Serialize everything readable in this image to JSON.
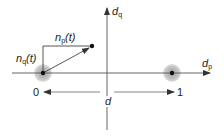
{
  "diagram": {
    "type": "constellation-noise-diagram",
    "axes": {
      "horizontal": {
        "symbol": "d",
        "subscript": "p"
      },
      "vertical": {
        "symbol": "d",
        "subscript": "q"
      }
    },
    "noise_labels": {
      "in_phase": {
        "symbol": "n",
        "subscript": "p",
        "arg": "(t)"
      },
      "quadrature": {
        "symbol": "n",
        "subscript": "q",
        "arg": "(t)"
      }
    },
    "points": [
      {
        "name": "symbol-0",
        "x": 43,
        "y": 73
      },
      {
        "name": "symbol-1",
        "x": 172,
        "y": 73
      },
      {
        "name": "noisy-sample",
        "x": 92,
        "y": 46
      }
    ],
    "distance": {
      "left_label": "0",
      "center_label": "d",
      "right_label": "1"
    },
    "colors": {
      "line": "#555555",
      "halo": "#bdbdbd",
      "dot": "#111111"
    }
  }
}
